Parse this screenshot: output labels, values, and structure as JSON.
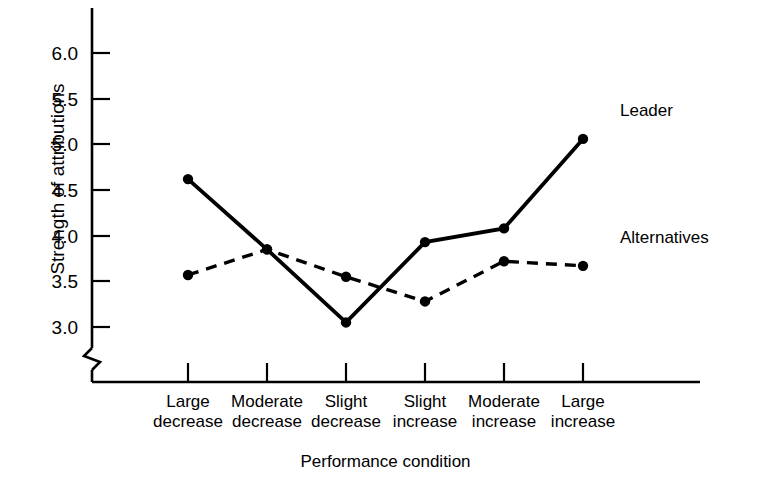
{
  "chart_data": {
    "type": "line",
    "title": "",
    "xlabel": "Performance condition",
    "ylabel": "Strength of attributions",
    "categories": [
      "Large decrease",
      "Moderate decrease",
      "Slight decrease",
      "Slight increase",
      "Moderate increase",
      "Large increase"
    ],
    "category_lines": [
      [
        "Large",
        "decrease"
      ],
      [
        "Moderate",
        "decrease"
      ],
      [
        "Slight",
        "decrease"
      ],
      [
        "Slight",
        "increase"
      ],
      [
        "Moderate",
        "increase"
      ],
      [
        "Large",
        "increase"
      ]
    ],
    "series": [
      {
        "name": "Leader",
        "style": "solid",
        "marker": "filled-circle",
        "values": [
          4.62,
          3.85,
          3.05,
          3.93,
          4.08,
          5.06
        ]
      },
      {
        "name": "Alternatives",
        "style": "dashed",
        "marker": "filled-circle",
        "values": [
          3.57,
          3.85,
          3.55,
          3.28,
          3.72,
          3.67
        ]
      }
    ],
    "ylim": [
      3.0,
      6.0
    ],
    "yticks": [
      3.0,
      3.5,
      4.0,
      4.5,
      5.0,
      5.5,
      6.0
    ],
    "ytick_labels": [
      "3.0",
      "3.5",
      "4.0",
      "4.5",
      "5.0",
      "5.5",
      "6.0"
    ],
    "y_axis_break": true,
    "grid": false,
    "legend_position": "inline-annotations",
    "line_color": "#000000",
    "background_color": "#ffffff"
  },
  "annotations": {
    "leader_label": "Leader",
    "alternatives_label": "Alternatives"
  }
}
